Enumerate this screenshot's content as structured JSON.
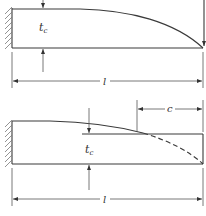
{
  "figures": [
    {
      "id": "top",
      "description": "Cantilever beam of full tapered profile with end load",
      "thickness_label": "t",
      "thickness_subscript": "c",
      "length_label": "l",
      "load": "point load at free end"
    },
    {
      "id": "bottom",
      "description": "Cantilever beam with constant-thickness end segment of length c; dashed theoretical profile",
      "thickness_label": "t",
      "thickness_subscript": "c",
      "length_label": "l",
      "segment_label": "c"
    }
  ],
  "colors": {
    "line": "#3a3a3a",
    "hatch": "#777777",
    "background": "#ffffff"
  }
}
